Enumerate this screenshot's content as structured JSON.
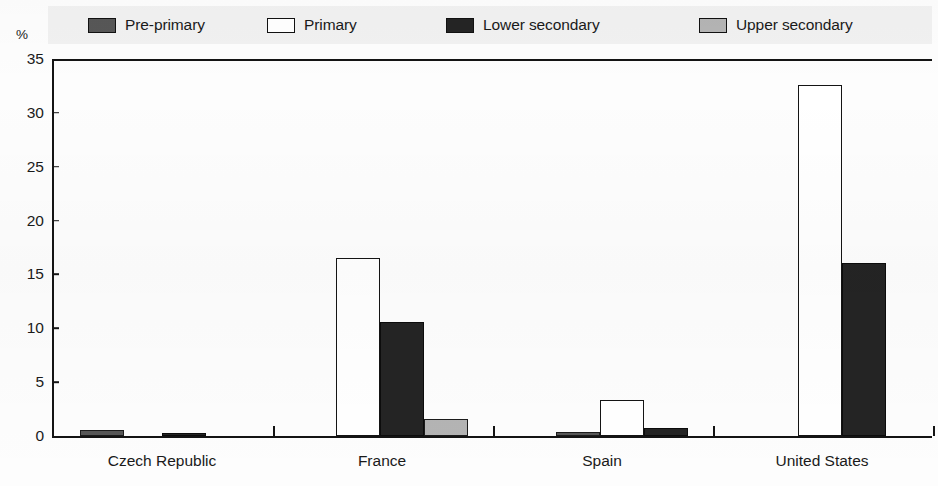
{
  "axis": {
    "unit_symbol": "%",
    "y_ticks": [
      0,
      5,
      10,
      15,
      20,
      25,
      30,
      35
    ],
    "y_tick_labels": [
      "0",
      "5",
      "10",
      "15",
      "20",
      "25",
      "30",
      "35"
    ]
  },
  "legend": {
    "entries": [
      {
        "label": "Pre-primary",
        "color": "#575757",
        "key": "pre-primary"
      },
      {
        "label": "Primary",
        "color": "#ffffff",
        "key": "primary"
      },
      {
        "label": "Lower secondary",
        "color": "#242424",
        "key": "lower-sec"
      },
      {
        "label": "Upper secondary",
        "color": "#b4b4b4",
        "key": "upper-sec"
      }
    ]
  },
  "chart_data": {
    "type": "bar",
    "title": "",
    "xlabel": "",
    "ylabel": "%",
    "ylim": [
      0,
      35
    ],
    "yticks": [
      0,
      5,
      10,
      15,
      20,
      25,
      30,
      35
    ],
    "grid": false,
    "legend_position": "top",
    "categories": [
      "Czech Republic",
      "France",
      "Spain",
      "United States"
    ],
    "series": [
      {
        "name": "Pre-primary",
        "color": "#575757",
        "values": [
          0.6,
          0.0,
          0.4,
          0.0
        ]
      },
      {
        "name": "Primary",
        "color": "#ffffff",
        "values": [
          0.0,
          16.5,
          3.3,
          32.6
        ]
      },
      {
        "name": "Lower secondary",
        "color": "#242424",
        "values": [
          0.3,
          10.6,
          0.7,
          16.1
        ]
      },
      {
        "name": "Upper secondary",
        "color": "#b4b4b4",
        "values": [
          0.0,
          1.6,
          0.0,
          0.0
        ]
      }
    ]
  }
}
